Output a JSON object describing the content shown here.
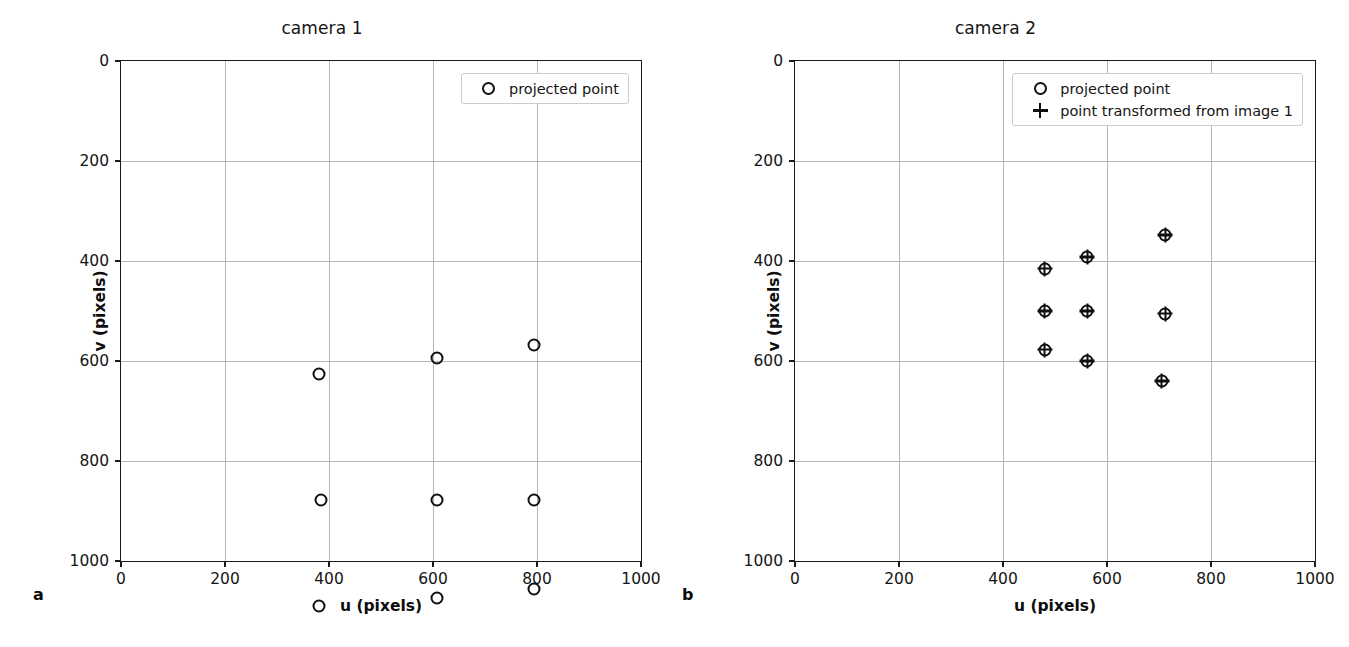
{
  "figure": {
    "panels": [
      {
        "letter": "a",
        "title": "camera 1",
        "xlabel": "u (pixels)",
        "ylabel": "v (pixels)"
      },
      {
        "letter": "b",
        "title": "camera 2",
        "xlabel": "u (pixels)",
        "ylabel": "v (pixels)"
      }
    ],
    "legend": {
      "projected_point": "projected point",
      "transformed_point": "point transformed from image 1",
      "marker_circle": "circle-marker-icon",
      "marker_plus": "plus-marker-icon"
    },
    "ticks": {
      "x": [
        "0",
        "200",
        "400",
        "600",
        "800",
        "1000"
      ],
      "y": [
        "0",
        "200",
        "400",
        "600",
        "800",
        "1000"
      ]
    }
  },
  "chart_data": [
    {
      "type": "scatter",
      "title": "camera 1",
      "panel": "a",
      "xlabel": "u (pixels)",
      "ylabel": "v (pixels)",
      "xlim": [
        0,
        1000
      ],
      "ylim": [
        1000,
        0
      ],
      "y_axis_inverted": true,
      "grid": true,
      "xticks": [
        0,
        200,
        400,
        600,
        800,
        1000
      ],
      "yticks": [
        0,
        200,
        400,
        600,
        800,
        1000
      ],
      "legend_position": "upper right",
      "series": [
        {
          "name": "projected point",
          "marker": "o",
          "points": [
            [
              381,
              625
            ],
            [
              608,
              593
            ],
            [
              795,
              567
            ],
            [
              384,
              877
            ],
            [
              608,
              877
            ],
            [
              795,
              877
            ],
            [
              381,
              1090
            ],
            [
              608,
              1073
            ],
            [
              795,
              1056
            ]
          ]
        }
      ]
    },
    {
      "type": "scatter",
      "title": "camera 2",
      "panel": "b",
      "xlabel": "u (pixels)",
      "ylabel": "v (pixels)",
      "xlim": [
        0,
        1000
      ],
      "ylim": [
        1000,
        0
      ],
      "y_axis_inverted": true,
      "grid": true,
      "xticks": [
        0,
        200,
        400,
        600,
        800,
        1000
      ],
      "yticks": [
        0,
        200,
        400,
        600,
        800,
        1000
      ],
      "legend_position": "upper right",
      "series": [
        {
          "name": "projected point",
          "marker": "o",
          "points": [
            [
              480,
              415
            ],
            [
              562,
              392
            ],
            [
              712,
              348
            ],
            [
              480,
              500
            ],
            [
              562,
              500
            ],
            [
              712,
              505
            ],
            [
              480,
              577
            ],
            [
              562,
              600
            ],
            [
              705,
              640
            ]
          ]
        },
        {
          "name": "point transformed from image 1",
          "marker": "+",
          "points": [
            [
              480,
              415
            ],
            [
              562,
              392
            ],
            [
              712,
              348
            ],
            [
              480,
              500
            ],
            [
              562,
              500
            ],
            [
              712,
              505
            ],
            [
              480,
              577
            ],
            [
              562,
              600
            ],
            [
              705,
              640
            ]
          ]
        }
      ]
    }
  ]
}
